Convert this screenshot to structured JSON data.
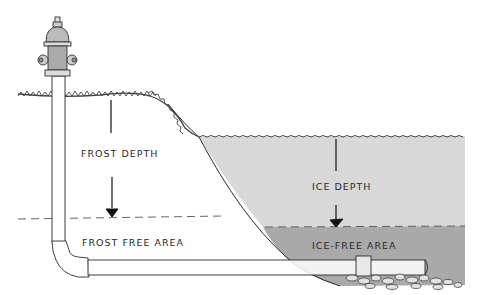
{
  "diagram": {
    "type": "cross-section illustration",
    "labels": {
      "frost_depth": "FROST DEPTH",
      "frost_free_area": "FROST FREE AREA",
      "ice_depth": "ICE DEPTH",
      "ice_free_area": "ICE-FREE AREA"
    },
    "colors": {
      "ice": "#d6d6d6",
      "ice_free_water": "#a9a9a9",
      "line": "#2b2b2b",
      "grass": "#444444",
      "background": "#ffffff"
    }
  }
}
